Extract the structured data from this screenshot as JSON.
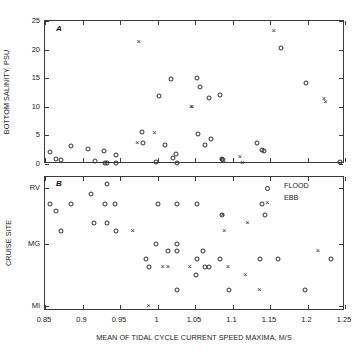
{
  "figure": {
    "panel_a_letter": "A",
    "panel_b_letter": "B"
  },
  "legend": {
    "position": "top-right-panel-b",
    "entries": [
      {
        "label": "FLOOD",
        "marker": "circle-open"
      },
      {
        "label": "EBB",
        "marker": "cross"
      }
    ]
  },
  "chart_data": [
    {
      "type": "scatter",
      "panel": "A",
      "title": "",
      "xlabel": "",
      "ylabel": "BOTTOM SALINITY, PSU",
      "xlim": [
        0.85,
        1.25
      ],
      "ylim": [
        0,
        25
      ],
      "yticks": [
        0,
        5,
        10,
        15,
        20,
        25
      ],
      "yticklabels": [
        "0",
        "5",
        "10",
        "15",
        "20",
        "25"
      ],
      "xticks": [
        0.85,
        0.9,
        0.95,
        1.0,
        1.05,
        1.1,
        1.15,
        1.2,
        1.25
      ],
      "xticklabels": [
        "",
        "",
        "",
        "",
        "",
        "",
        "",
        "",
        ""
      ],
      "grid": false,
      "series": [
        {
          "name": "FLOOD",
          "marker": "circle-open",
          "points": [
            [
              0.857,
              2.1
            ],
            [
              0.864,
              0.8
            ],
            [
              0.871,
              0.7
            ],
            [
              0.885,
              3.2
            ],
            [
              0.907,
              2.7
            ],
            [
              0.916,
              0.6
            ],
            [
              0.929,
              2.2
            ],
            [
              0.93,
              0.2
            ],
            [
              0.932,
              0.2
            ],
            [
              0.944,
              1.6
            ],
            [
              0.945,
              0.2
            ],
            [
              0.979,
              5.6
            ],
            [
              0.98,
              3.7
            ],
            [
              0.998,
              0.4
            ],
            [
              1.002,
              11.9
            ],
            [
              1.01,
              3.4
            ],
            [
              1.018,
              14.8
            ],
            [
              1.021,
              1.0
            ],
            [
              1.024,
              1.8
            ],
            [
              1.026,
              0.1
            ],
            [
              1.052,
              15.0
            ],
            [
              1.054,
              5.2
            ],
            [
              1.057,
              13.4
            ],
            [
              1.063,
              3.3
            ],
            [
              1.068,
              11.5
            ],
            [
              1.071,
              4.3
            ],
            [
              1.083,
              12.1
            ],
            [
              1.086,
              0.9
            ],
            [
              1.087,
              0.7
            ],
            [
              1.133,
              3.6
            ],
            [
              1.139,
              2.4
            ],
            [
              1.142,
              2.3
            ],
            [
              1.165,
              20.3
            ],
            [
              1.198,
              14.2
            ],
            [
              1.243,
              0.3
            ]
          ]
        },
        {
          "name": "EBB",
          "marker": "cross",
          "points": [
            [
              0.975,
              21.4
            ],
            [
              0.973,
              3.6
            ],
            [
              0.996,
              5.4
            ],
            [
              1.045,
              10.0
            ],
            [
              1.046,
              10.0
            ],
            [
              1.085,
              0.8
            ],
            [
              1.11,
              1.2
            ],
            [
              1.113,
              0.2
            ],
            [
              1.155,
              23.3
            ],
            [
              1.222,
              11.3
            ],
            [
              1.224,
              10.9
            ]
          ]
        }
      ]
    },
    {
      "type": "scatter",
      "panel": "B",
      "title": "",
      "xlabel": "MEAN OF TIDAL CYCLE CURRENT SPEED MAXIMA, M/S",
      "ylabel": "CRUISE SITE",
      "xlim": [
        0.85,
        1.25
      ],
      "ylim": [
        0,
        1
      ],
      "yticks": [
        0.92,
        0.5,
        0.04
      ],
      "yticklabels": [
        "RV",
        "MG",
        "MI"
      ],
      "xticks": [
        0.85,
        0.9,
        0.95,
        1.0,
        1.05,
        1.1,
        1.15,
        1.2,
        1.25
      ],
      "xticklabels": [
        "0.85",
        "0.9",
        "0.95",
        "1",
        "1.05",
        "1.1",
        "1.15",
        "1.2",
        "1.25"
      ],
      "grid": false,
      "series": [
        {
          "name": "FLOOD",
          "marker": "circle-open",
          "points": [
            [
              0.932,
              0.95
            ],
            [
              0.911,
              0.87
            ],
            [
              0.857,
              0.8
            ],
            [
              0.884,
              0.8
            ],
            [
              0.93,
              0.8
            ],
            [
              0.943,
              0.8
            ],
            [
              1.0,
              0.8
            ],
            [
              1.026,
              0.8
            ],
            [
              1.052,
              0.8
            ],
            [
              1.139,
              0.8
            ],
            [
              0.864,
              0.745
            ],
            [
              1.086,
              0.715
            ],
            [
              1.143,
              0.715
            ],
            [
              0.915,
              0.655
            ],
            [
              0.932,
              0.655
            ],
            [
              0.871,
              0.595
            ],
            [
              0.944,
              0.595
            ],
            [
              0.998,
              0.5
            ],
            [
              1.026,
              0.5
            ],
            [
              1.014,
              0.445
            ],
            [
              1.026,
              0.445
            ],
            [
              1.06,
              0.445
            ],
            [
              0.984,
              0.385
            ],
            [
              1.053,
              0.385
            ],
            [
              1.083,
              0.385
            ],
            [
              1.136,
              0.385
            ],
            [
              1.16,
              0.385
            ],
            [
              1.231,
              0.385
            ],
            [
              0.988,
              0.325
            ],
            [
              1.063,
              0.325
            ],
            [
              1.069,
              0.325
            ],
            [
              1.051,
              0.265
            ],
            [
              1.026,
              0.16
            ],
            [
              1.095,
              0.16
            ],
            [
              1.196,
              0.16
            ]
          ]
        },
        {
          "name": "EBB",
          "marker": "cross",
          "points": [
            [
              1.087,
              0.715
            ],
            [
              1.12,
              0.655
            ],
            [
              0.967,
              0.595
            ],
            [
              1.089,
              0.595
            ],
            [
              1.214,
              0.445
            ],
            [
              1.007,
              0.325
            ],
            [
              1.014,
              0.325
            ],
            [
              1.043,
              0.325
            ],
            [
              1.094,
              0.325
            ],
            [
              1.117,
              0.265
            ],
            [
              1.136,
              0.16
            ],
            [
              0.988,
              0.04
            ]
          ]
        }
      ]
    }
  ]
}
